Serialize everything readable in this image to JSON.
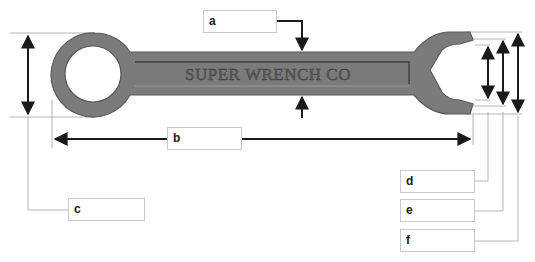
{
  "diagram": {
    "wrench_engraving": "SUPER WRENCH CO",
    "colors": {
      "wrench_fill": "#7b7b7b",
      "wrench_stroke": "#555555",
      "arrow": "#1a1a1a",
      "leader_line": "#b5b5b5",
      "box_border": "#c8c8c8"
    },
    "labels": [
      {
        "id": "a",
        "text": "a",
        "describes": "handle thickness"
      },
      {
        "id": "b",
        "text": "b",
        "describes": "overall length"
      },
      {
        "id": "c",
        "text": "c",
        "describes": "ring end outer diameter"
      },
      {
        "id": "d",
        "text": "d",
        "describes": "jaw opening width"
      },
      {
        "id": "e",
        "text": "e",
        "describes": "jaw inner tip span"
      },
      {
        "id": "f",
        "text": "f",
        "describes": "open end outer height"
      }
    ]
  }
}
